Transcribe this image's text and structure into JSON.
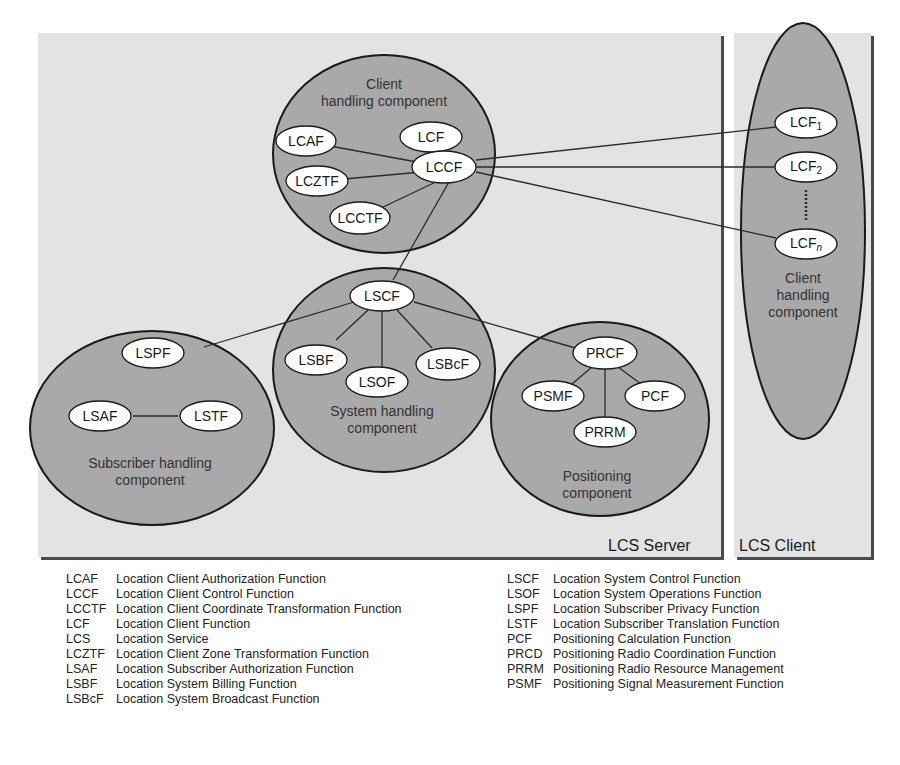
{
  "colors": {
    "panel_bg": "#e3e3e3",
    "component_fill": "#a9a9a9",
    "node_fill": "#ffffff",
    "stroke": "#1a1a1a"
  },
  "panels": {
    "server": {
      "label": "LCS Server"
    },
    "client": {
      "label": "LCS Client"
    }
  },
  "components": {
    "client_handling": {
      "label_line1": "Client",
      "label_line2": "handling component"
    },
    "system_handling": {
      "label_line1": "System handling",
      "label_line2": "component"
    },
    "subscriber_handling": {
      "label_line1": "Subscriber handling",
      "label_line2": "component"
    },
    "positioning": {
      "label_line1": "Positioning",
      "label_line2": "component"
    },
    "client_side": {
      "label_line1": "Client",
      "label_line2": "handling",
      "label_line3": "component"
    }
  },
  "nodes": {
    "lcaf": "LCAF",
    "lcf": "LCF",
    "lccf": "LCCF",
    "lcztf": "LCZTF",
    "lcctf": "LCCTF",
    "lscf": "LSCF",
    "lsbf": "LSBF",
    "lsof": "LSOF",
    "lsbcf": "LSBcF",
    "lspf": "LSPF",
    "lsaf": "LSAF",
    "lstf": "LSTF",
    "prcf": "PRCF",
    "psmf": "PSMF",
    "pcf": "PCF",
    "prrm": "PRRM",
    "lcf1": {
      "base": "LCF",
      "sub": "1"
    },
    "lcf2": {
      "base": "LCF",
      "sub": "2"
    },
    "lcfn": {
      "base": "LCF",
      "sub": "n"
    }
  },
  "legend": {
    "left": [
      {
        "abbr": "LCAF",
        "text": "Location Client Authorization Function"
      },
      {
        "abbr": "LCCF",
        "text": "Location Client Control Function"
      },
      {
        "abbr": "LCCTF",
        "text": "Location Client Coordinate Transformation Function"
      },
      {
        "abbr": "LCF",
        "text": "Location Client Function"
      },
      {
        "abbr": "LCS",
        "text": "Location Service"
      },
      {
        "abbr": "LCZTF",
        "text": "Location Client Zone Transformation Function"
      },
      {
        "abbr": "LSAF",
        "text": "Location Subscriber Authorization Function"
      },
      {
        "abbr": "LSBF",
        "text": "Location System Billing Function"
      },
      {
        "abbr": "LSBcF",
        "text": "Location System Broadcast Function"
      }
    ],
    "right": [
      {
        "abbr": "LSCF",
        "text": "Location System Control Function"
      },
      {
        "abbr": "LSOF",
        "text": "Location System Operations Function"
      },
      {
        "abbr": "LSPF",
        "text": "Location Subscriber Privacy Function"
      },
      {
        "abbr": "LSTF",
        "text": "Location Subscriber Translation Function"
      },
      {
        "abbr": "PCF",
        "text": "Positioning Calculation Function"
      },
      {
        "abbr": "PRCD",
        "text": "Positioning Radio Coordination Function"
      },
      {
        "abbr": "PRRM",
        "text": "Positioning Radio Resource Management"
      },
      {
        "abbr": "PSMF",
        "text": "Positioning Signal Measurement Function"
      }
    ]
  }
}
